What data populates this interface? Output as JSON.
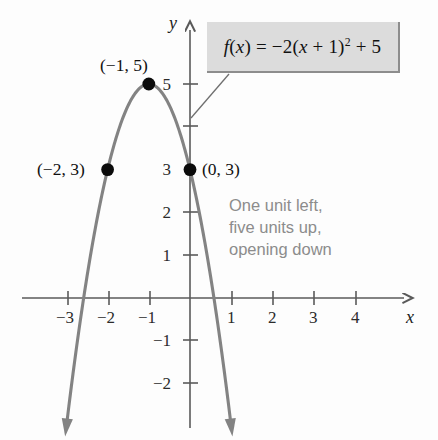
{
  "figure": {
    "kind": "coordinate-plane-parabola",
    "x_axis_label": "x",
    "y_axis_label": "y"
  },
  "chart_data": {
    "type": "line",
    "title": "",
    "subtitle": "",
    "xlabel": "x",
    "ylabel": "y",
    "xlim": [
      -3.6,
      4.8
    ],
    "ylim": [
      -2.9,
      5.9
    ],
    "grid": false,
    "legend": "none",
    "function": {
      "expression_plain": "f(x) = -2(x + 1)^2 + 5",
      "leading_coefficient": -2,
      "horizontal_shift": -1,
      "vertical_shift": 5,
      "opens": "down",
      "vertex": [
        -1,
        5
      ]
    },
    "x_ticks": [
      -3,
      -2,
      -1,
      1,
      2,
      3,
      4
    ],
    "x_tick_labels": [
      "−3",
      "−2",
      "−1",
      "1",
      "2",
      "3",
      "4"
    ],
    "y_ticks": [
      5,
      4,
      3,
      2,
      1,
      -1,
      -2
    ],
    "y_tick_labels": [
      "5",
      "4",
      "3",
      "2",
      "1",
      "−1",
      "−2"
    ],
    "y_tick_labels_shown": [
      "5",
      "3",
      "2",
      "1",
      "−1",
      "−2"
    ],
    "series": [
      {
        "name": "f(x) = -2(x + 1)^2 + 5",
        "x": [
          -3.4,
          -3.2,
          -3.0,
          -2.8,
          -2.6,
          -2.4,
          -2.2,
          -2.0,
          -1.8,
          -1.6,
          -1.4,
          -1.2,
          -1.0,
          -0.8,
          -0.6,
          -0.4,
          -0.2,
          0.0,
          0.2,
          0.4,
          0.6,
          0.8,
          1.0,
          1.2,
          1.4
        ],
        "y": [
          -6.52,
          -4.68,
          -3.0,
          -1.48,
          -0.12,
          1.08,
          2.12,
          3.0,
          3.72,
          4.28,
          4.68,
          4.92,
          5.0,
          4.92,
          4.68,
          4.28,
          3.72,
          3.0,
          2.12,
          1.08,
          -0.12,
          -1.48,
          -3.0,
          -4.68,
          -6.52
        ]
      }
    ],
    "marked_points": [
      {
        "id": "vertex",
        "x": -1,
        "y": 5,
        "label": "(−1, 5)"
      },
      {
        "id": "left-point",
        "x": -2,
        "y": 3,
        "label": "(−2, 3)"
      },
      {
        "id": "y-intercept",
        "x": 0,
        "y": 3,
        "label": "(0, 3)"
      }
    ],
    "annotations": [
      {
        "id": "formula-callout",
        "text": "f(x) = −2(x + 1)² + 5",
        "style": "boxed-callout-with-leader"
      },
      {
        "id": "transformation-note",
        "text": "One unit left, five units up, opening down",
        "style": "plain-gray-text"
      }
    ]
  },
  "callout": {
    "f_name": "f",
    "f_open": "(",
    "f_var": "x",
    "f_close": ")",
    "equals": " = ",
    "coefficient": "−2(",
    "inner_var": "x",
    "inner_rest": " + 1)",
    "exponent": "2",
    "tail": " + 5"
  },
  "description": {
    "line1": "One unit left,",
    "line2": "five units up,",
    "line3": "opening down"
  },
  "point_labels": {
    "vertex": "(−1, 5)",
    "left": "(−2, 3)",
    "y_intercept": "(0, 3)"
  },
  "tick_labels": {
    "x": [
      "−3",
      "−2",
      "−1",
      "1",
      "2",
      "3",
      "4"
    ],
    "y": [
      "5",
      "3",
      "2",
      "1",
      "−1",
      "−2"
    ]
  },
  "axis_labels": {
    "x": "x",
    "y": "y"
  },
  "colors": {
    "curve": "#838383",
    "axis": "#5a5a5a",
    "point": "#0b0b0b",
    "callout_bg": "#dcdcdc",
    "description_text": "#8c8c8c",
    "background": "#fdfdfd"
  }
}
